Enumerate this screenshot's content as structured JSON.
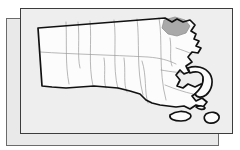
{
  "graphic": {
    "kind": "locator-map",
    "subject": "Massachusetts county map",
    "highlighted_region": "Essex County",
    "title": "",
    "caption": "",
    "label_text": ""
  },
  "colors": {
    "page_background": "#ffffff",
    "sheet_front_fill": "#eeeeee",
    "sheet_back_fill": "#e9e9e9",
    "sheet_front_border": "#3c3c3c",
    "sheet_back_border": "#6b6b6b",
    "county_fill": "#fcfcfc",
    "county_border": "#9a9a9a",
    "state_outline": "#111111",
    "highlight_fill": "#a9a9a9"
  },
  "sheets": [
    {
      "name": "back-sheet",
      "x": 6,
      "y": 18,
      "w": 213,
      "h": 128
    },
    {
      "name": "front-sheet",
      "x": 20,
      "y": 8,
      "w": 213,
      "h": 126
    }
  ],
  "map": {
    "state_outline_path": "M 20 18 L 145 10 L 152 14 L 157 11 L 163 14 L 170 12 L 175 17 L 171 23 L 176 26 L 174 31 L 179 33 L 176 38 L 181 40 L 178 45 L 172 44 L 168 49 L 172 54 L 166 58 L 169 64 L 164 66 L 160 62 L 156 67 L 160 72 L 157 78 L 163 80 L 168 76 L 175 79 L 181 76 L 186 80 L 183 86 L 178 84 L 172 88 L 176 93 L 182 90 L 187 94 L 183 99 L 176 97 L 170 101 L 164 98 L 158 101 L 152 97 L 146 100 L 140 96 L 134 99 L 128 95 L 122 97 L 116 93 L 110 95 L 104 91 L 98 94 L 92 90 L 86 92 L 80 88 L 74 90 L 68 86 L 62 88 L 56 84 L 50 86 L 44 82 L 38 84 L 32 80 L 26 82 L 22 78 Z",
    "cape_cod_path": "M 168 60 L 176 58 L 184 60 L 190 66 L 193 74 L 191 82 L 186 87 L 179 89 L 175 85 L 180 81 L 184 75 L 183 68 L 177 64 L 170 65 Z",
    "islands": [
      {
        "name": "marthas-vineyard",
        "path": "M 150 106 L 160 103 L 168 105 L 171 110 L 165 113 L 156 112 L 150 110 Z"
      },
      {
        "name": "nantucket",
        "path": "M 186 106 L 195 104 L 199 108 L 196 114 L 189 115 L 184 111 Z"
      }
    ],
    "highlighted_county_path": "M 144 12 L 155 9 L 165 12 L 170 18 L 166 25 L 157 28 L 148 26 L 142 20 Z",
    "county_line_paths": [
      "M 48 14 L 50 74",
      "M 72 12 L 74 78",
      "M 95 11 L 98 82",
      "M 118 10 L 122 86",
      "M 140 9 L 144 90",
      "M 22 46 L 150 50",
      "M 118 52 L 126 96",
      "M 140 60 L 168 66",
      "M 144 76 L 172 86"
    ]
  }
}
